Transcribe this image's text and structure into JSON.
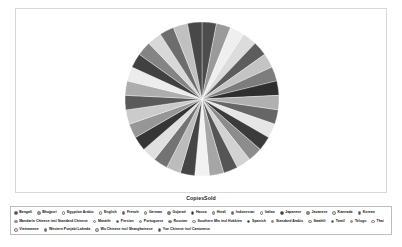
{
  "chart_title": "CopiesSold",
  "legend": {
    "rows": [
      [
        0,
        1,
        2,
        3,
        4,
        5,
        6,
        7,
        8,
        9,
        10,
        11,
        12,
        13,
        14
      ],
      [
        15,
        16,
        17,
        18,
        19,
        20,
        21,
        22,
        23,
        24,
        25,
        26,
        27,
        28
      ],
      [
        29,
        30,
        31,
        32,
        33,
        34
      ]
    ]
  },
  "chart_data": {
    "type": "pie",
    "title": "CopiesSold",
    "xlabel": "",
    "ylabel": "",
    "grid": false,
    "legend_position": "bottom",
    "categories": [
      "Bengali",
      "Bhojpuri",
      "Egyptian Arabic",
      "English",
      "French",
      "German",
      "Gujarati",
      "Hausa",
      "Hindi",
      "Indonesian",
      "Italian",
      "Japanese",
      "Javanese",
      "Kannada",
      "Korean",
      "Mandarin Chinese incl Standard Chinese",
      "Marathi",
      "Persian",
      "Portuguese",
      "Russian",
      "Southern Min incl Hokkien",
      "Spanish",
      "Standard Arabic",
      "Swahili",
      "Tamil",
      "Telugu",
      "Thai",
      "Turkish",
      "Urdu",
      "Vietnamese",
      "Western Punjabi Lahnda",
      "Wu Chinese incl Shanghainese",
      "Yue Chinese incl Cantonese"
    ],
    "values": [
      1,
      1,
      1,
      1,
      1,
      1,
      1,
      1,
      1,
      1,
      1,
      1,
      1,
      1,
      1,
      1,
      1,
      1,
      1,
      1,
      1,
      1,
      1,
      1,
      1,
      1,
      1,
      1,
      1,
      1,
      1,
      1,
      1
    ],
    "colors": [
      "#4d4d4d",
      "#9a9a9a",
      "#efefef",
      "#dcdcdc",
      "#5d5d5d",
      "#c4c4c4",
      "#7d7d7d",
      "#2f2f2f",
      "#b0b0b0",
      "#666666",
      "#e6e6e6",
      "#3b3b3b",
      "#8c8c8c",
      "#d2d2d2",
      "#555555",
      "#a6a6a6",
      "#f2f2f2",
      "#454545",
      "#bcbcbc",
      "#737373",
      "#e0e0e0",
      "#353535",
      "#969696",
      "#cbcbcb",
      "#5a5a5a",
      "#adadad",
      "#ececec",
      "#414141",
      "#848484",
      "#d8d8d8",
      "#6d6d6d",
      "#c0c0c0",
      "#484848"
    ]
  }
}
